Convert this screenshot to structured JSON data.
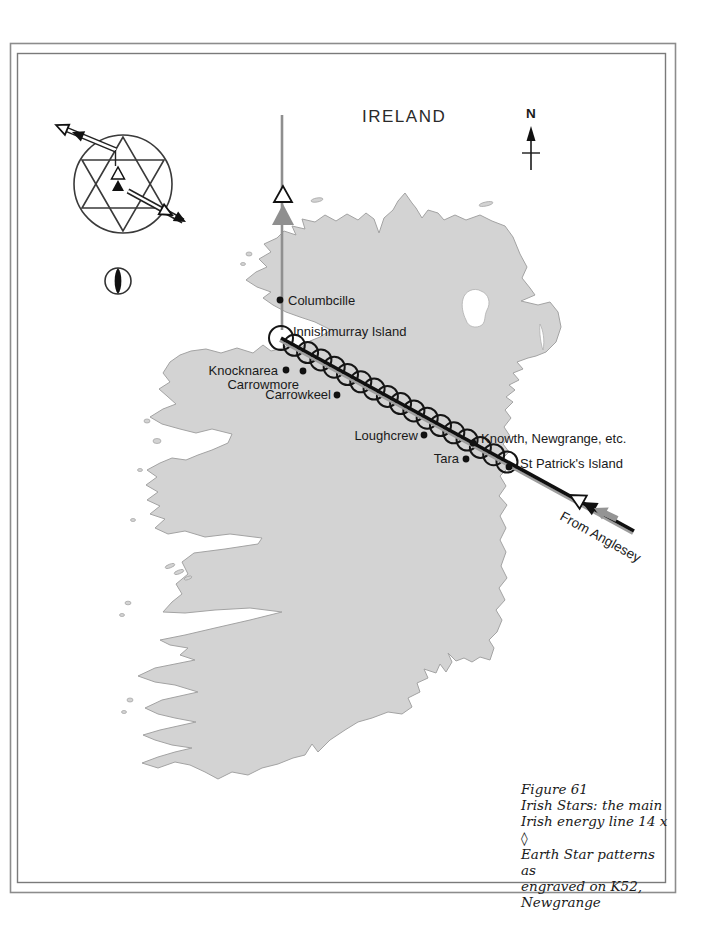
{
  "header": {
    "title": "IRELAND"
  },
  "compass": {
    "label": "N"
  },
  "energy_line": {
    "from_label": "From Anglesey",
    "start": {
      "x": 281,
      "y": 338
    },
    "end": {
      "x": 507,
      "y": 462
    },
    "circle_count": 18
  },
  "places": [
    {
      "label": "Columbcille",
      "x": 288,
      "y": 305,
      "anchor": "start",
      "dot": [
        280,
        300
      ]
    },
    {
      "label": "Innishmurray Island",
      "x": 293,
      "y": 336,
      "anchor": "start",
      "dot": null
    },
    {
      "label": "Knocknarea",
      "x": 278,
      "y": 375,
      "anchor": "end",
      "dot": [
        286,
        370
      ]
    },
    {
      "label": "Carrowmore",
      "x": 299,
      "y": 389,
      "anchor": "end",
      "dot": [
        303,
        371
      ]
    },
    {
      "label": "Carrowkeel",
      "x": 331,
      "y": 399,
      "anchor": "end",
      "dot": [
        337,
        395
      ]
    },
    {
      "label": "Loughcrew",
      "x": 418,
      "y": 440,
      "anchor": "end",
      "dot": [
        424,
        435
      ]
    },
    {
      "label": "Knowth, Newgrange, etc.",
      "x": 481,
      "y": 443,
      "anchor": "start",
      "dot": [
        473,
        443
      ]
    },
    {
      "label": "Tara",
      "x": 459,
      "y": 463,
      "anchor": "end",
      "dot": [
        466,
        459
      ]
    },
    {
      "label": "St Patrick's Island",
      "x": 520,
      "y": 468,
      "anchor": "start",
      "dot": [
        509,
        467
      ]
    }
  ],
  "caption": {
    "lines": [
      "Figure 61",
      "Irish Stars: the main",
      "Irish energy line 14 x ◊",
      "Earth Star patterns as",
      "engraved on K52,",
      "Newgrange"
    ]
  },
  "colors": {
    "land": "#d3d3d3",
    "coast": "#a3a3a3",
    "line_black": "#101010",
    "line_gray": "#9e9e9e",
    "arrow_gray": "#8f8f8f",
    "text": "#1a1a1a"
  }
}
